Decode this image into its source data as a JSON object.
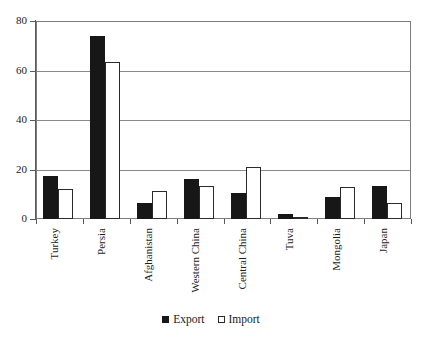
{
  "chart_data": {
    "type": "bar",
    "title": "",
    "subtitle": "",
    "xlabel": "",
    "ylabel": "",
    "categories": [
      "Turkey",
      "Persia",
      "Afghanistan",
      "Western China",
      "Central China",
      "Tuva",
      "Mongolia",
      "Japan"
    ],
    "series": [
      {
        "name": "Export",
        "color": "#171717",
        "fill": "solid",
        "values": [
          17.5,
          74,
          6.5,
          16,
          10.5,
          2,
          9,
          13.5
        ]
      },
      {
        "name": "Import",
        "color": "#ffffff",
        "fill": "hollow",
        "values": [
          12,
          63.5,
          11.5,
          13.5,
          21,
          0.7,
          13,
          6.5
        ]
      }
    ],
    "ylim": [
      0,
      80
    ],
    "yticks": [
      0,
      20,
      40,
      60,
      80
    ],
    "ytick_labels": [
      "0",
      "20",
      "40",
      "60",
      "80"
    ],
    "grid": true,
    "grid_axis": "y",
    "legend_position": "bottom-center",
    "label_rotation": 90
  },
  "legend": {
    "entries": [
      {
        "label": "Export",
        "swatch": "filled-square-black"
      },
      {
        "label": "Import",
        "swatch": "hollow-square-white"
      }
    ]
  },
  "title_remnant": {
    "text": ""
  }
}
